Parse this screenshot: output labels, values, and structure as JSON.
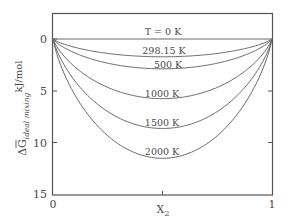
{
  "chart_data": {
    "type": "line",
    "title": "",
    "xlabel": "X2",
    "ylabel": "ΔḠ ideal mixing kJ/mol",
    "ylabel_parts": {
      "symbol": "ΔG",
      "subscript": "ideal mixing",
      "units": "kJ/mol"
    },
    "xlim": [
      0,
      1
    ],
    "ylim": [
      0,
      15
    ],
    "y_inverted": true,
    "grid": false,
    "legend": "inline curve labels",
    "x_ticks": [
      "0",
      "1"
    ],
    "y_ticks": [
      "0",
      "5",
      "10",
      "15"
    ],
    "series": [
      {
        "name": "T = 0 K",
        "temperature_K": 0,
        "min_value_at_x_0.5": 0.0
      },
      {
        "name": "298.15 K",
        "temperature_K": 298.15,
        "min_value_at_x_0.5": 1.72
      },
      {
        "name": "500 K",
        "temperature_K": 500,
        "min_value_at_x_0.5": 2.88
      },
      {
        "name": "1000 K",
        "temperature_K": 1000,
        "min_value_at_x_0.5": 5.76
      },
      {
        "name": "1500 K",
        "temperature_K": 1500,
        "min_value_at_x_0.5": 8.64
      },
      {
        "name": "2000 K",
        "temperature_K": 2000,
        "min_value_at_x_0.5": 11.53
      }
    ],
    "line_color": "#6a6a6a",
    "axis_color": "#555555"
  },
  "labels": {
    "x_tick_0": "0",
    "x_tick_1": "1",
    "y_tick_0": "0",
    "y_tick_5": "5",
    "y_tick_10": "10",
    "y_tick_15": "15",
    "x_axis_main": "X",
    "x_axis_sub": "2",
    "y_axis_symbol": "ΔG",
    "y_axis_sub": "ideal mixing",
    "y_axis_units": "kJ/mol",
    "curve_0": "T = 0 K",
    "curve_298": "298.15 K",
    "curve_500": "500 K",
    "curve_1000": "1000 K",
    "curve_1500": "1500 K",
    "curve_2000": "2000 K"
  }
}
